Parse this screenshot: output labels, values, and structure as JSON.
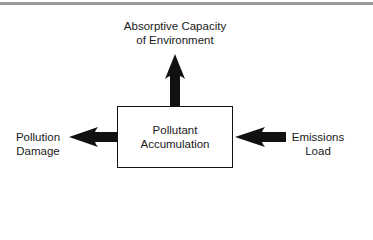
{
  "diagram": {
    "top_rule_color": "#9a9a9a",
    "center_node": {
      "lines": [
        "Pollutant",
        "Accumulation"
      ]
    },
    "outputs": [
      {
        "direction": "up",
        "lines": [
          "Absorptive Capacity",
          "of Environment"
        ]
      },
      {
        "direction": "left",
        "lines": [
          "Pollution",
          "Damage"
        ]
      }
    ],
    "inputs": [
      {
        "direction": "from-right",
        "lines": [
          "Emissions",
          "Load"
        ]
      }
    ],
    "arrow_color": "#111111"
  }
}
